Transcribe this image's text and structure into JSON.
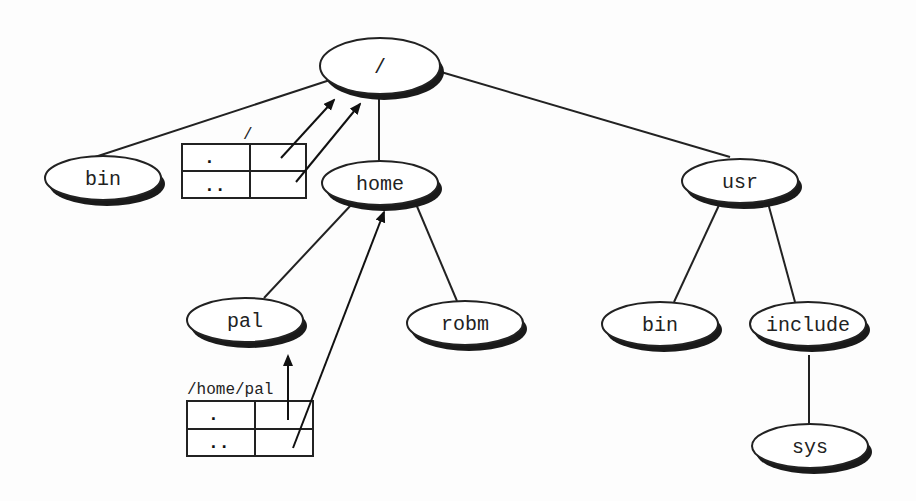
{
  "diagram": {
    "type": "directory-tree",
    "nodes": [
      {
        "id": "root",
        "label": "/",
        "cx": 380,
        "cy": 66,
        "rx": 60,
        "ry": 28
      },
      {
        "id": "bin",
        "label": "bin",
        "cx": 103,
        "cy": 178,
        "rx": 58,
        "ry": 22
      },
      {
        "id": "home",
        "label": "home",
        "cx": 380,
        "cy": 183,
        "rx": 58,
        "ry": 22
      },
      {
        "id": "usr",
        "label": "usr",
        "cx": 740,
        "cy": 181,
        "rx": 58,
        "ry": 22
      },
      {
        "id": "pal",
        "label": "pal",
        "cx": 245,
        "cy": 320,
        "rx": 58,
        "ry": 22
      },
      {
        "id": "robm",
        "label": "robm",
        "cx": 465,
        "cy": 323,
        "rx": 58,
        "ry": 22
      },
      {
        "id": "usr-bin",
        "label": "bin",
        "cx": 660,
        "cy": 324,
        "rx": 58,
        "ry": 22
      },
      {
        "id": "include",
        "label": "include",
        "cx": 808,
        "cy": 324,
        "rx": 58,
        "ry": 22
      },
      {
        "id": "sys",
        "label": "sys",
        "cx": 810,
        "cy": 446,
        "rx": 58,
        "ry": 22
      }
    ],
    "edges": [
      {
        "from": "root",
        "to": "bin"
      },
      {
        "from": "root",
        "to": "home"
      },
      {
        "from": "root",
        "to": "usr"
      },
      {
        "from": "home",
        "to": "pal"
      },
      {
        "from": "home",
        "to": "robm"
      },
      {
        "from": "usr",
        "to": "usr-bin"
      },
      {
        "from": "usr",
        "to": "include"
      },
      {
        "from": "include",
        "to": "sys"
      }
    ],
    "directory_tables": [
      {
        "id": "root-dir",
        "caption": "/",
        "entries": [
          ".",
          ".."
        ],
        "x": 182,
        "y": 144,
        "w": 124,
        "h": 54
      },
      {
        "id": "pal-dir",
        "caption": "/home/pal",
        "entries": [
          ".",
          ".."
        ],
        "x": 187,
        "y": 401,
        "w": 126,
        "h": 55
      }
    ],
    "link_arrows": [
      {
        "from_table": "root-dir",
        "entry": ".",
        "points_to": "root"
      },
      {
        "from_table": "root-dir",
        "entry": "..",
        "points_to": "root"
      },
      {
        "from_table": "pal-dir",
        "entry": ".",
        "points_to": "pal"
      },
      {
        "from_table": "pal-dir",
        "entry": "..",
        "points_to": "home"
      }
    ]
  }
}
